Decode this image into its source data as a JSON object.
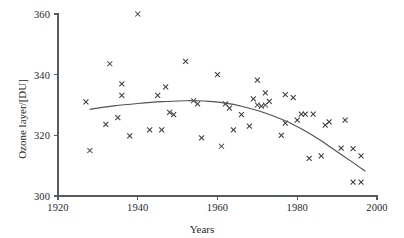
{
  "chart_data": {
    "type": "scatter",
    "title": "",
    "xlabel": "Years",
    "ylabel": "Ozone layer/[DU]",
    "xlim": [
      1920,
      2000
    ],
    "ylim": [
      300,
      360
    ],
    "grid": false,
    "legend": "none",
    "xticks": [
      1920,
      1940,
      1960,
      1980,
      2000
    ],
    "yticks": [
      300,
      320,
      340,
      360
    ],
    "marker": "x",
    "series": [
      {
        "name": "Ozone layer measurements",
        "points": [
          [
            1927,
            331.0
          ],
          [
            1928,
            315.0
          ],
          [
            1932,
            323.6
          ],
          [
            1933,
            343.6
          ],
          [
            1935,
            325.8
          ],
          [
            1936,
            337.0
          ],
          [
            1936,
            333.2
          ],
          [
            1938,
            319.8
          ],
          [
            1940,
            360.0
          ],
          [
            1943,
            321.8
          ],
          [
            1945,
            333.2
          ],
          [
            1946,
            321.8
          ],
          [
            1947,
            336.0
          ],
          [
            1948,
            327.6
          ],
          [
            1949,
            326.8
          ],
          [
            1952,
            344.4
          ],
          [
            1954,
            331.4
          ],
          [
            1955,
            330.4
          ],
          [
            1956,
            319.2
          ],
          [
            1960,
            340.0
          ],
          [
            1961,
            316.4
          ],
          [
            1962,
            330.4
          ],
          [
            1963,
            329.0
          ],
          [
            1964,
            321.8
          ],
          [
            1966,
            326.8
          ],
          [
            1968,
            323.0
          ],
          [
            1969,
            332.0
          ],
          [
            1970,
            338.2
          ],
          [
            1970,
            330.0
          ],
          [
            1971,
            329.6
          ],
          [
            1972,
            330.0
          ],
          [
            1972,
            334.0
          ],
          [
            1973,
            331.2
          ],
          [
            1976,
            320.0
          ],
          [
            1977,
            333.4
          ],
          [
            1977,
            324.0
          ],
          [
            1979,
            332.4
          ],
          [
            1980,
            325.0
          ],
          [
            1981,
            327.0
          ],
          [
            1982,
            327.0
          ],
          [
            1983,
            312.4
          ],
          [
            1984,
            327.0
          ],
          [
            1986,
            313.2
          ],
          [
            1987,
            323.4
          ],
          [
            1988,
            324.4
          ],
          [
            1991,
            315.8
          ],
          [
            1992,
            325.0
          ],
          [
            1994,
            315.6
          ],
          [
            1994,
            304.6
          ],
          [
            1996,
            313.2
          ],
          [
            1996,
            304.6
          ]
        ]
      }
    ],
    "trend": {
      "name": "fitted quadratic trend",
      "points": [
        [
          1928,
          328.6
        ],
        [
          1934,
          329.7
        ],
        [
          1940,
          330.5
        ],
        [
          1946,
          331.1
        ],
        [
          1952,
          331.4
        ],
        [
          1955,
          331.4
        ],
        [
          1958,
          331.2
        ],
        [
          1962,
          330.6
        ],
        [
          1966,
          329.6
        ],
        [
          1970,
          328.2
        ],
        [
          1974,
          326.4
        ],
        [
          1978,
          324.2
        ],
        [
          1982,
          321.4
        ],
        [
          1986,
          318.2
        ],
        [
          1990,
          314.6
        ],
        [
          1994,
          311.0
        ],
        [
          1997,
          308.2
        ]
      ]
    }
  }
}
